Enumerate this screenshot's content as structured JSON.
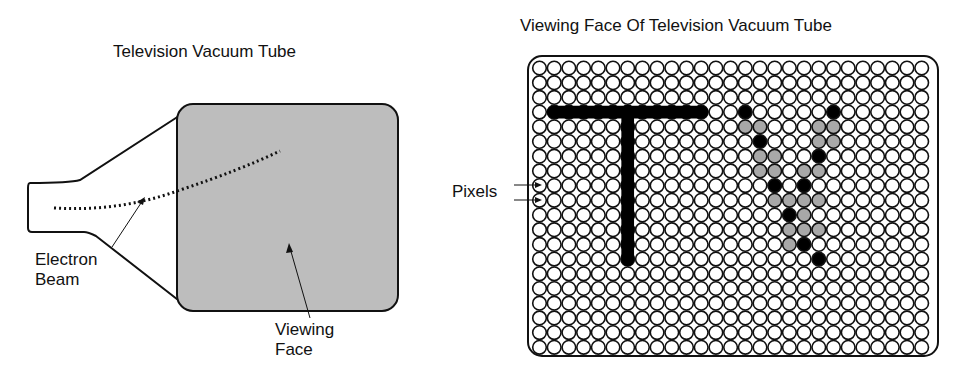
{
  "left_panel": {
    "title": "Television Vacuum Tube",
    "labels": {
      "electron_beam_line1": "Electron",
      "electron_beam_line2": "Beam",
      "viewing_face_line1": "Viewing",
      "viewing_face_line2": "Face"
    },
    "face_fill": "#bdbdbd"
  },
  "right_panel": {
    "title": "Viewing Face Of Television Vacuum Tube",
    "pixels_label": "Pixels",
    "grid": {
      "cols": 27,
      "rows": 20,
      "pitch": 14.7,
      "origin_x": 539.5,
      "origin_y": 68
    },
    "colors": {
      "on": "#000000",
      "partial": "#a8a8a8",
      "off": "#ffffff",
      "stroke": "#111111"
    },
    "letter_T": {
      "bar": {
        "row": 3,
        "col_start": 1,
        "col_end": 11
      },
      "stem": {
        "col": 6,
        "row_start": 3,
        "row_end": 13
      }
    },
    "letter_V_dark": [
      [
        3,
        14
      ],
      [
        5,
        15
      ],
      [
        8,
        16
      ],
      [
        10,
        17
      ],
      [
        12,
        18
      ],
      [
        13,
        19
      ],
      [
        3,
        20
      ],
      [
        6,
        19
      ],
      [
        8,
        18
      ],
      [
        10,
        17
      ]
    ],
    "letter_V_gray": [
      [
        4,
        14
      ],
      [
        4,
        15
      ],
      [
        6,
        15
      ],
      [
        6,
        16
      ],
      [
        7,
        15
      ],
      [
        7,
        16
      ],
      [
        9,
        16
      ],
      [
        9,
        17
      ],
      [
        11,
        17
      ],
      [
        11,
        18
      ],
      [
        12,
        17
      ],
      [
        4,
        19
      ],
      [
        4,
        20
      ],
      [
        5,
        19
      ],
      [
        5,
        20
      ],
      [
        7,
        18
      ],
      [
        7,
        19
      ],
      [
        9,
        18
      ],
      [
        9,
        19
      ],
      [
        10,
        18
      ],
      [
        11,
        19
      ]
    ]
  }
}
